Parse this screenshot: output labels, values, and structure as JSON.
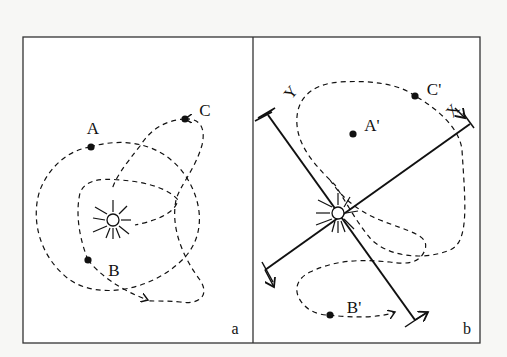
{
  "figure": {
    "panels": [
      {
        "id": "a",
        "panel_label": "a",
        "points": [
          {
            "label": "A"
          },
          {
            "label": "B"
          },
          {
            "label": "C"
          }
        ]
      },
      {
        "id": "b",
        "panel_label": "b",
        "points": [
          {
            "label": "A'"
          },
          {
            "label": "B'"
          },
          {
            "label": "C'"
          }
        ],
        "axes": {
          "x_label": "X",
          "y_label": "Y"
        }
      }
    ],
    "colors": {
      "stroke": "#111111",
      "frame": "#333333",
      "background": "#f7f7f5"
    }
  }
}
